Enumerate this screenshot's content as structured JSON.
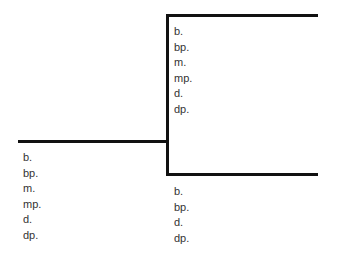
{
  "diagram": {
    "type": "tree-bracket",
    "line_color": "#111111",
    "root": {
      "labels": [
        "b.",
        "bp.",
        "m.",
        "mp.",
        "d.",
        "dp."
      ]
    },
    "branches": [
      {
        "position": "upper",
        "labels": [
          "b.",
          "bp.",
          "m.",
          "mp.",
          "d.",
          "dp."
        ]
      },
      {
        "position": "lower",
        "labels": [
          "b.",
          "bp.",
          "d.",
          "dp."
        ]
      }
    ]
  }
}
